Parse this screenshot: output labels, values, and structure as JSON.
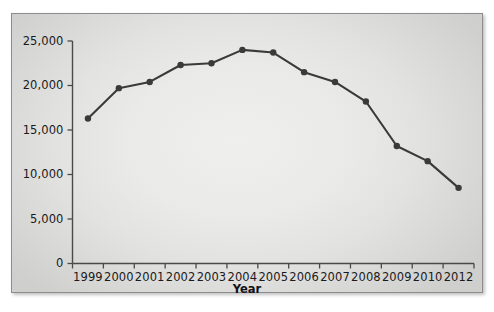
{
  "figure": {
    "background_color": "#ffffff",
    "panel_background_color": "#e6e6e5",
    "panel_border_color": "#8c8c8c",
    "series_color": "#3a3a3a",
    "axis_color": "#4a4a4a",
    "text_color": "#1a1a1a"
  },
  "chart_data": {
    "type": "line",
    "title": "",
    "subtitle": "",
    "xlabel": "Year",
    "ylabel": "",
    "categories": [
      "1999",
      "2000",
      "2001",
      "2002",
      "2003",
      "2004",
      "2005",
      "2006",
      "2007",
      "2008",
      "2009",
      "2010",
      "2012"
    ],
    "values": [
      16300,
      19700,
      20400,
      22300,
      22500,
      24000,
      23700,
      21500,
      20400,
      18200,
      13200,
      11500,
      8500
    ],
    "series": [
      {
        "name": "Series 1",
        "values": [
          16300,
          19700,
          20400,
          22300,
          22500,
          24000,
          23700,
          21500,
          20400,
          18200,
          13200,
          11500,
          8500
        ]
      }
    ],
    "ylim": [
      0,
      25000
    ],
    "yticks": [
      0,
      5000,
      10000,
      15000,
      20000,
      25000
    ],
    "ytick_labels": [
      "0",
      "5,000",
      "10,000",
      "15,000",
      "20,000",
      "25,000"
    ],
    "xtick_labels": [
      "1999",
      "2000",
      "2001",
      "2002",
      "2003",
      "2004",
      "2005",
      "2006",
      "2007",
      "2008",
      "2009",
      "2010",
      "2012"
    ],
    "grid": false,
    "legend": false,
    "legend_position": "none",
    "marker": "circle",
    "annotations": []
  },
  "axes": {
    "x_title": "Year",
    "y_title": ""
  }
}
